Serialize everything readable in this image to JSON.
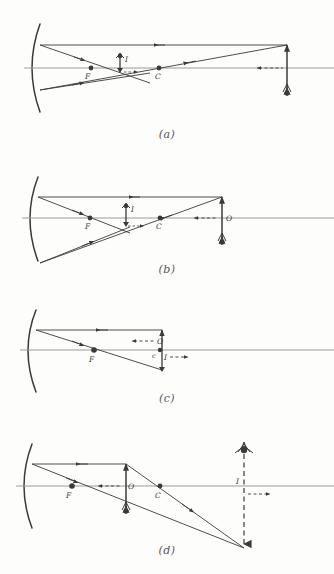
{
  "figure": {
    "background_color": "#fdfdfb",
    "ink_color": "#3a3a3a",
    "axis_color": "#8a8a8a"
  },
  "panels": [
    {
      "caption": "(a)",
      "description": "Object beyond the centre of curvature C; image is real, inverted, diminished, located between F and C.",
      "labels": {
        "focus": "F",
        "centre": "C",
        "object": "O",
        "image": "I"
      },
      "object_position": "beyond C",
      "image_position": "between F and C",
      "image_nature": "real, inverted, diminished"
    },
    {
      "caption": "(b)",
      "description": "Object still beyond C but nearer; image is real, inverted, diminished, between F and C.",
      "labels": {
        "focus": "F",
        "centre": "C",
        "object": "O",
        "image": "I"
      },
      "object_position": "beyond C",
      "image_position": "between F and C",
      "image_nature": "real, inverted, diminished"
    },
    {
      "caption": "(c)",
      "description": "Object at the centre of curvature C; image is real, inverted, same size, at C.",
      "labels": {
        "focus": "F",
        "centre": "c",
        "object": "O",
        "image": "I"
      },
      "object_position": "at C",
      "image_position": "at C",
      "image_nature": "real, inverted, same size"
    },
    {
      "caption": "(d)",
      "description": "Object between F and C; image is real, inverted, magnified, beyond C.",
      "labels": {
        "focus": "F",
        "centre": "C",
        "object": "O",
        "image": "I"
      },
      "object_position": "between F and C",
      "image_position": "beyond C",
      "image_nature": "real, inverted, magnified"
    }
  ],
  "legend": {
    "mirror": "concave-mirror",
    "principal_axis": "principal-axis",
    "ray_marker": "direction-arrowhead",
    "dashed_marker": "dashed-size-indicator"
  }
}
